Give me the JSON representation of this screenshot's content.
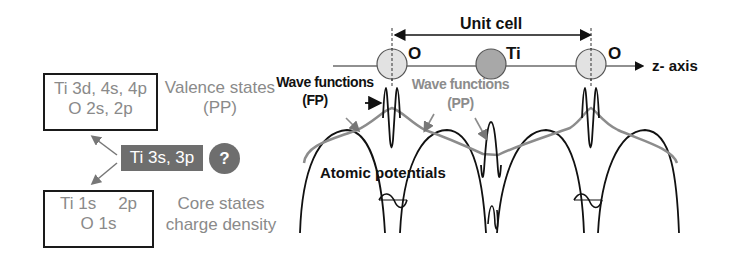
{
  "left_panel": {
    "valence_box": {
      "line1": "Ti 3d, 4s, 4p",
      "line2": "O 2s, 2p"
    },
    "valence_label": {
      "line1": "Valence states",
      "line2": "(PP)"
    },
    "semicore_tag": {
      "label": "Ti 3s, 3p"
    },
    "question_badge": {
      "label": "?"
    },
    "core_box": {
      "line1a": "Ti 1s",
      "line1b": "2p",
      "line2": "O 1s"
    },
    "core_label": {
      "line1": "Core states",
      "line2": "charge density"
    }
  },
  "right_panel": {
    "unit_cell_label": "Unit cell",
    "axis_label": "z- axis",
    "atoms": [
      {
        "name": "O",
        "color": "#e2e2e2"
      },
      {
        "name": "Ti",
        "color": "#a8a8a8"
      },
      {
        "name": "O",
        "color": "#e2e2e2"
      }
    ],
    "wave_fp_label": {
      "line1": "Wave functions",
      "line2": "(FP)"
    },
    "wave_pp_label": {
      "line1": "Wave functions",
      "line2": "(PP)"
    },
    "potentials_label": "Atomic potentials"
  },
  "colors": {
    "dark": "#111111",
    "gray_text": "#8a8a8a",
    "pp_curve": "#8c8c8c",
    "tag_bg": "#6e6e6e",
    "badge_bg": "#6e6e6e"
  }
}
